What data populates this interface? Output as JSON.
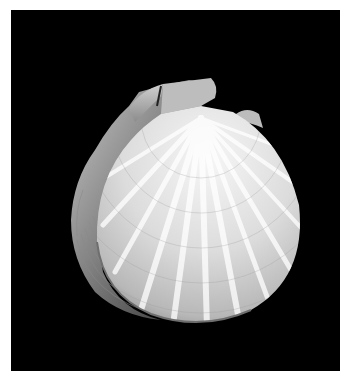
{
  "image": {
    "subject": "scallop shell",
    "background_color": "#000000",
    "border_color": "#ffffff",
    "shell_tones": [
      "#f4f4f4",
      "#d8d8d8",
      "#9a9a9a",
      "#4a4a4a"
    ]
  }
}
